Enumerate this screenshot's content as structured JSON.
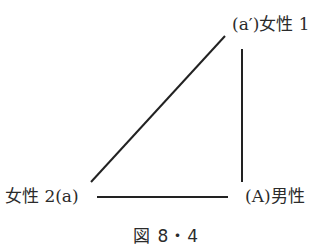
{
  "diagram": {
    "nodes": [
      {
        "id": "a_prime",
        "label": "(a′)女性 1"
      },
      {
        "id": "a",
        "label": "女性 2(a)"
      },
      {
        "id": "A",
        "label": "(A)男性"
      }
    ],
    "edges": [
      {
        "from": "a",
        "to": "a_prime"
      },
      {
        "from": "a_prime",
        "to": "A"
      },
      {
        "from": "a",
        "to": "A"
      }
    ],
    "line_color": "#222222"
  },
  "caption": "図 8・4"
}
